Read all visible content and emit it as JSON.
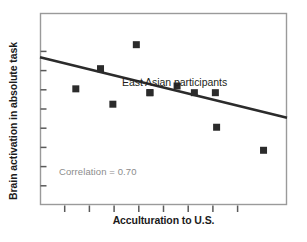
{
  "figure": {
    "background": "#ffffff",
    "frame_color": "#9a9a9a",
    "axis_color": "#4d4d4d"
  },
  "labels": {
    "ylabel": "Brain activation in absolute task",
    "xlabel": "Acculturation to U.S."
  },
  "annotations": {
    "correlation": "Correlation = 0.70",
    "group": "East Asian participants",
    "correlation_color": "#8c8c8c",
    "group_color": "#231f20"
  },
  "chart_data": {
    "type": "scatter",
    "title": "",
    "xlabel": "Acculturation to U.S.",
    "ylabel": "Brain activation in absolute task",
    "xlim": [
      0,
      10
    ],
    "ylim": [
      0,
      10
    ],
    "grid": false,
    "legend": null,
    "xticks": [
      1,
      2,
      3,
      4,
      5,
      6,
      7,
      8
    ],
    "xticklabels": [],
    "yticks": [
      1,
      2,
      3,
      4,
      5,
      6,
      7,
      8
    ],
    "yticklabels": [],
    "marker": "square",
    "marker_color": "#2b2b2b",
    "marker_size_px": 7,
    "points": [
      {
        "x": 1.45,
        "y": 6.05
      },
      {
        "x": 2.45,
        "y": 7.1
      },
      {
        "x": 2.95,
        "y": 5.25
      },
      {
        "x": 3.9,
        "y": 8.35
      },
      {
        "x": 4.45,
        "y": 5.85
      },
      {
        "x": 5.55,
        "y": 6.2
      },
      {
        "x": 6.25,
        "y": 5.85
      },
      {
        "x": 7.1,
        "y": 5.85
      },
      {
        "x": 7.15,
        "y": 4.05
      },
      {
        "x": 9.05,
        "y": 2.85
      },
      {
        "x": 4.45,
        "y": 5.85
      }
    ],
    "trendline": {
      "x0": 0.0,
      "y0": 7.7,
      "x1": 10.0,
      "y1": 4.55,
      "color": "#2b2b2b",
      "width_px": 2.6,
      "correlation": -0.7,
      "correlation_label": "Correlation = 0.70"
    },
    "annotation_texts": [
      "East Asian participants",
      "Correlation = 0.70"
    ]
  },
  "geometry": {
    "plot_left": 40,
    "plot_right": 287,
    "plot_top": 13,
    "plot_bottom": 205
  }
}
